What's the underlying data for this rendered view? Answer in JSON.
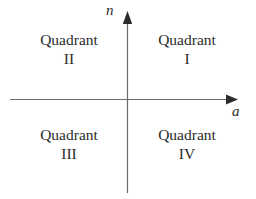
{
  "figure": {
    "type": "coordinate-plane-quadrant-diagram",
    "background_color": "#ffffff",
    "axis_color": "#6a6a6a",
    "text_color": "#2b2b2b",
    "width": 256,
    "height": 199
  },
  "axes": {
    "vertical": {
      "label": "n",
      "arrow_direction": "up",
      "origin_x": 127,
      "top_y": 11,
      "bottom_y": 193
    },
    "horizontal": {
      "label": "a",
      "arrow_direction": "right",
      "origin_y": 99,
      "left_x": 10,
      "right_x": 238
    }
  },
  "quadrants": [
    {
      "id": "i",
      "word": "Quadrant",
      "numeral": "I",
      "position": "top-right"
    },
    {
      "id": "ii",
      "word": "Quadrant",
      "numeral": "II",
      "position": "top-left"
    },
    {
      "id": "iii",
      "word": "Quadrant",
      "numeral": "III",
      "position": "bottom-left"
    },
    {
      "id": "iv",
      "word": "Quadrant",
      "numeral": "IV",
      "position": "bottom-right"
    }
  ]
}
